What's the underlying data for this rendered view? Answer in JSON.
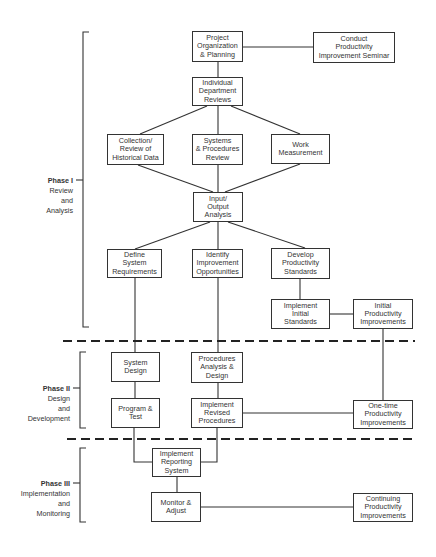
{
  "diagram": {
    "phases": [
      {
        "id": "phase1",
        "title": "Phase I",
        "description": "Review\nand\nAnalysis"
      },
      {
        "id": "phase2",
        "title": "Phase II",
        "description": "Design\nand\nDevelopment"
      },
      {
        "id": "phase3",
        "title": "Phase III",
        "description": "Implementation\nand\nMonitoring"
      }
    ],
    "boxes": {
      "project_org": "Project\nOrganization\n& Planning",
      "conduct_seminar": "Conduct\nProductivity\nImprovement Seminar",
      "dept_reviews": "Individual\nDepartment\nReviews",
      "collection": "Collection/\nReview of\nHistorical Data",
      "systems_procedures": "Systems\n& Procedures\nReview",
      "work_measurement": "Work\nMeasurement",
      "input_output": "Input/\nOutput\nAnalysis",
      "define_system": "Define\nSystem\nRequirements",
      "identify_improvement": "Identify\nImprovement\nOpportunities",
      "develop_standards": "Develop\nProductivity\nStandards",
      "implement_standards": "Implement\nInitial\nStandards",
      "initial_improvements": "Initial\nProductivity\nImprovements",
      "system_design": "System\nDesign",
      "procedures_analysis": "Procedures\nAnalysis &\nDesign",
      "program_test": "Program &\nTest",
      "implement_revised": "Implement\nRevised\nProcedures",
      "onetime_improvements": "One-time\nProductivity\nImprovements",
      "implement_reporting": "Implement\nReporting\nSystem",
      "monitor_adjust": "Monitor &\nAdjust",
      "continuing_improvements": "Continuing\nProductivity\nImprovements"
    },
    "colors": {
      "line": "#333333",
      "background": "#ffffff"
    }
  }
}
